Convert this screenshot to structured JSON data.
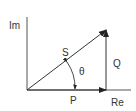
{
  "diagram": {
    "axes": {
      "imaginary_label": "Im",
      "real_label": "Re"
    },
    "vectors": [
      {
        "name": "S",
        "label": "S",
        "description": "apparent power"
      },
      {
        "name": "P",
        "label": "P",
        "description": "real power"
      },
      {
        "name": "Q",
        "label": "Q",
        "description": "reactive power"
      }
    ],
    "angle": {
      "label": "θ"
    },
    "colors": {
      "line": "#333333",
      "background": "#ffffff"
    }
  }
}
